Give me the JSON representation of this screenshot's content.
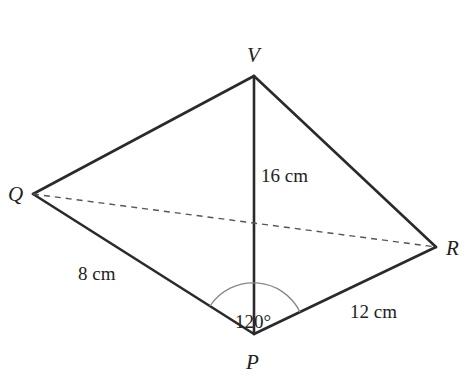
{
  "diagram": {
    "type": "pyramid-tetrahedron",
    "vertices": {
      "V": {
        "label": "V",
        "x": 254,
        "y": 76
      },
      "Q": {
        "label": "Q",
        "x": 33,
        "y": 194
      },
      "R": {
        "label": "R",
        "x": 436,
        "y": 247
      },
      "P": {
        "label": "P",
        "x": 254,
        "y": 334
      }
    },
    "edges": [
      {
        "from": "V",
        "to": "Q",
        "style": "solid"
      },
      {
        "from": "V",
        "to": "R",
        "style": "solid"
      },
      {
        "from": "V",
        "to": "P",
        "style": "solid",
        "label": "16 cm"
      },
      {
        "from": "Q",
        "to": "P",
        "style": "solid",
        "label": "8 cm"
      },
      {
        "from": "R",
        "to": "P",
        "style": "solid",
        "label": "12 cm"
      },
      {
        "from": "Q",
        "to": "R",
        "style": "dashed"
      }
    ],
    "labels": {
      "vp": "16 cm",
      "qp": "8 cm",
      "rp": "12 cm",
      "angle_qpr": "120°"
    },
    "colors": {
      "line": "#2a2a2a",
      "dashed": "#555555",
      "arc": "#888888",
      "text": "#222222"
    }
  }
}
